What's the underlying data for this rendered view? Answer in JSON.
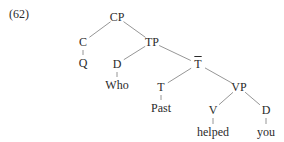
{
  "example_number": "(62)",
  "tree": {
    "nodes": [
      {
        "id": "CP",
        "label": "CP",
        "x": 117,
        "y": 17
      },
      {
        "id": "C",
        "label": "C",
        "x": 83,
        "y": 42
      },
      {
        "id": "Q",
        "label": "Q",
        "x": 83,
        "y": 63
      },
      {
        "id": "TP",
        "label": "TP",
        "x": 152,
        "y": 42
      },
      {
        "id": "D1",
        "label": "D",
        "x": 117,
        "y": 64
      },
      {
        "id": "Who",
        "label": "Who",
        "x": 117,
        "y": 85
      },
      {
        "id": "Tbar",
        "label": "T",
        "x": 198,
        "y": 64,
        "overline": true
      },
      {
        "id": "T",
        "label": "T",
        "x": 161,
        "y": 87
      },
      {
        "id": "Past",
        "label": "Past",
        "x": 161,
        "y": 108
      },
      {
        "id": "VP",
        "label": "VP",
        "x": 239,
        "y": 87
      },
      {
        "id": "V",
        "label": "V",
        "x": 213,
        "y": 110
      },
      {
        "id": "helped",
        "label": "helped",
        "x": 213,
        "y": 132
      },
      {
        "id": "D2",
        "label": "D",
        "x": 266,
        "y": 110
      },
      {
        "id": "you",
        "label": "you",
        "x": 266,
        "y": 132
      }
    ],
    "edges": [
      [
        "CP",
        "C"
      ],
      [
        "CP",
        "TP"
      ],
      [
        "C",
        "Q"
      ],
      [
        "TP",
        "D1"
      ],
      [
        "TP",
        "Tbar"
      ],
      [
        "D1",
        "Who"
      ],
      [
        "Tbar",
        "T"
      ],
      [
        "Tbar",
        "VP"
      ],
      [
        "T",
        "Past"
      ],
      [
        "VP",
        "V"
      ],
      [
        "VP",
        "D2"
      ],
      [
        "V",
        "helped"
      ],
      [
        "D2",
        "you"
      ]
    ]
  }
}
